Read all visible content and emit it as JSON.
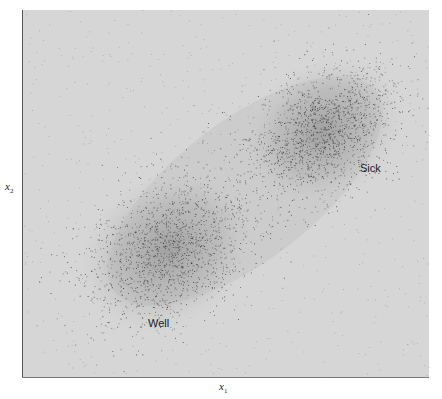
{
  "chart_data": {
    "type": "scatter",
    "title": "",
    "xlabel": "x",
    "xlabel_subscript": "1",
    "ylabel": "x",
    "ylabel_subscript": "2",
    "grid": false,
    "legend": "none",
    "axis_ticks": false,
    "plot_area": {
      "left": 22,
      "top": 10,
      "right": 429,
      "bottom": 377
    },
    "colors": {
      "plot_background": "#d6d6d6",
      "halo": "#a8a8a8",
      "points": "#2a2a2a",
      "axis_line": "#555555"
    },
    "series": [
      {
        "name": "Sick",
        "label": "Sick",
        "center_px": [
          322,
          132
        ],
        "spread_px": [
          38,
          34
        ],
        "correlation": 0.35,
        "n_points": 1500
      },
      {
        "name": "Well",
        "label": "Well",
        "center_px": [
          168,
          250
        ],
        "spread_px": [
          42,
          38
        ],
        "correlation": 0.35,
        "n_points": 1500
      }
    ],
    "annotations": [
      {
        "text": "Sick",
        "x_px": 360,
        "y_px": 168
      },
      {
        "text": "Well",
        "x_px": 148,
        "y_px": 323
      }
    ]
  },
  "labels": {
    "x_axis": "x",
    "x_axis_sub": "1",
    "y_axis": "x",
    "y_axis_sub": "2",
    "sick": "Sick",
    "well": "Well"
  }
}
